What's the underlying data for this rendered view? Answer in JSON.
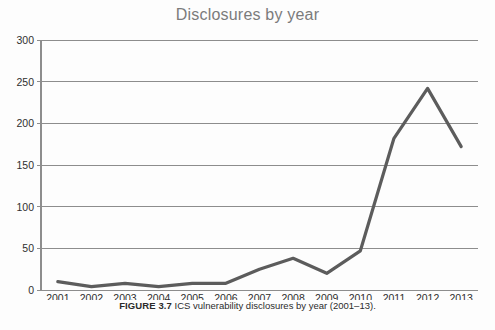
{
  "figure": {
    "title": "Disclosures by year",
    "caption_label": "FIGURE 3.7",
    "caption_text": "ICS vulnerability disclosures by year (2001‒13)."
  },
  "chart_data": {
    "type": "line",
    "title": "Disclosures by year",
    "xlabel": "",
    "ylabel": "",
    "categories": [
      "2001",
      "2002",
      "2003",
      "2004",
      "2005",
      "2006",
      "2007",
      "2008",
      "2009",
      "2010",
      "2011",
      "2012",
      "2013"
    ],
    "values": [
      10,
      4,
      8,
      4,
      8,
      8,
      25,
      38,
      20,
      47,
      182,
      242,
      172
    ],
    "ylim": [
      0,
      300
    ],
    "yticks": [
      0,
      50,
      100,
      150,
      200,
      250,
      300
    ],
    "ytick_labels": [
      "0",
      "50",
      "100",
      "150",
      "200",
      "250",
      "300"
    ],
    "grid": true,
    "grid_axis": "y",
    "legend": false,
    "legend_position": "none",
    "series": [
      {
        "name": "Disclosures",
        "color": "#5c5c5c",
        "values": [
          10,
          4,
          8,
          4,
          8,
          8,
          25,
          38,
          20,
          47,
          182,
          242,
          172
        ]
      }
    ]
  },
  "colors": {
    "line": "#5c5c5c",
    "grid": "#8d8d8d",
    "title": "#7b7b7b",
    "tick_text": "#2f2f2f",
    "caption": "#2b2b2b",
    "background": "#fdfdfd"
  }
}
